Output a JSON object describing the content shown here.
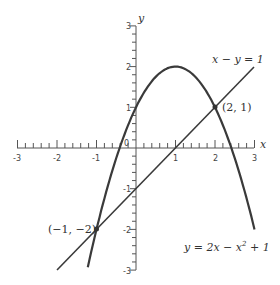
{
  "chart_data": {
    "type": "line",
    "title": "",
    "xlabel": "x",
    "ylabel": "y",
    "xlim": [
      -3,
      3
    ],
    "ylim": [
      -3,
      3
    ],
    "x_ticks": [
      "-3",
      "-2",
      "-1",
      "0",
      "1",
      "2",
      "3"
    ],
    "y_ticks": [
      "3",
      "2",
      "1",
      "0",
      "-1",
      "-2",
      "-3"
    ],
    "grid": false,
    "series": [
      {
        "name": "y = 2x − x² + 1",
        "kind": "parabola",
        "x_range": [
          -1.22,
          3.0
        ],
        "vertex": [
          1,
          2
        ]
      },
      {
        "name": "x − y = 1",
        "kind": "line",
        "x_range": [
          -2,
          3
        ]
      }
    ],
    "annotations": [
      {
        "text": "(2, 1)",
        "point": [
          2,
          1
        ]
      },
      {
        "text": "(−1, −2)",
        "point": [
          -1,
          -2
        ]
      },
      {
        "text": "x − y = 1",
        "attached_to": "line"
      },
      {
        "text": "y = 2x − x² + 1",
        "attached_to": "parabola"
      }
    ]
  },
  "labels": {
    "x_axis": "x",
    "y_axis": "y",
    "origin": "0",
    "line_eq": "x − y = 1",
    "parabola_eq_prefix": "y = 2x − x",
    "parabola_eq_exp": "2",
    "parabola_eq_suffix": " + 1",
    "point_a": "(2, 1)",
    "point_b": "(−1, −2)",
    "xt_m3": "-3",
    "xt_m2": "-2",
    "xt_m1": "-1",
    "xt_1": "1",
    "xt_2": "2",
    "xt_3": "3",
    "yt_3": "3",
    "yt_2": "2",
    "yt_1": "1",
    "yt_m1": "-1",
    "yt_m2": "-2",
    "yt_m3": "-3"
  },
  "colors": {
    "curve": "#3a3a3a",
    "axis": "#555555",
    "background": "#ffffff"
  }
}
